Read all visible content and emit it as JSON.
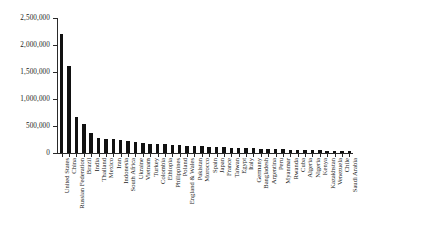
{
  "chart_data": {
    "type": "bar",
    "title": "",
    "subtitle": "",
    "xlabel": "",
    "ylabel": "",
    "ylim": [
      0,
      2500000
    ],
    "grid": false,
    "legend": null,
    "bar_color": "#111111",
    "axis_color": "#2a2a2a",
    "background": "#ffffff",
    "ytick_labels": [
      "0",
      "500,000",
      "1,000,000",
      "1,500,000",
      "2,000,000",
      "2,500,000"
    ],
    "ytick_values": [
      0,
      500000,
      1000000,
      1500000,
      2000000,
      2500000
    ],
    "categories": [
      "United States",
      "China",
      "Russian Federation",
      "Brazil",
      "India",
      "Thailand",
      "Mexico",
      "Iran",
      "Indonesia",
      "South Africa",
      "Ukraine",
      "Vietnam",
      "Turkey",
      "Colombia",
      "Ethiopia",
      "Philippines",
      "Poland",
      "England & Wales",
      "Pakistan",
      "Morocco",
      "Spain",
      "Japan",
      "France",
      "Taiwan",
      "Egypt",
      "Italy",
      "Germany",
      "Bangladesh",
      "Argentina",
      "Peru",
      "Myanmar",
      "Rwanda",
      "Cuba",
      "Algeria",
      "Nigeria",
      "Kenya",
      "Kazakhstan",
      "Venezuela",
      "Chile",
      "Saudi Arabia"
    ],
    "values": [
      2200000,
      1620000,
      675000,
      540000,
      375000,
      285000,
      265000,
      255000,
      235000,
      215000,
      195000,
      180000,
      172000,
      165000,
      158000,
      150000,
      143000,
      136000,
      130000,
      124000,
      118000,
      112000,
      106000,
      100000,
      95000,
      90000,
      85000,
      80000,
      75000,
      70000,
      66000,
      62000,
      58000,
      55000,
      52000,
      49000,
      46000,
      43000,
      40000,
      36000
    ]
  }
}
